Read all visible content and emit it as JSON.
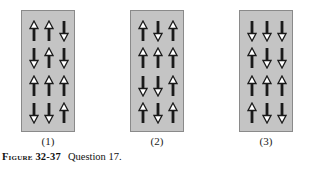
{
  "figure": {
    "number_label": "Figure 32-37",
    "caption": "Question 17.",
    "colors": {
      "panel_bg": "#c4c4c4",
      "arrow": "#1a1a1a",
      "arrow_head_fill": "#ffffff"
    },
    "panels": [
      {
        "label": "(1)",
        "rows": [
          [
            "up",
            "up",
            "down"
          ],
          [
            "down",
            "up",
            "down"
          ],
          [
            "up",
            "up",
            "up"
          ],
          [
            "down",
            "down",
            "up"
          ]
        ]
      },
      {
        "label": "(2)",
        "rows": [
          [
            "up",
            "down",
            "up"
          ],
          [
            "up",
            "up",
            "up"
          ],
          [
            "down",
            "down",
            "up"
          ],
          [
            "up",
            "down",
            "up"
          ]
        ]
      },
      {
        "label": "(3)",
        "rows": [
          [
            "down",
            "down",
            "down"
          ],
          [
            "up",
            "down",
            "down"
          ],
          [
            "up",
            "up",
            "up"
          ],
          [
            "up",
            "down",
            "down"
          ]
        ]
      }
    ]
  }
}
